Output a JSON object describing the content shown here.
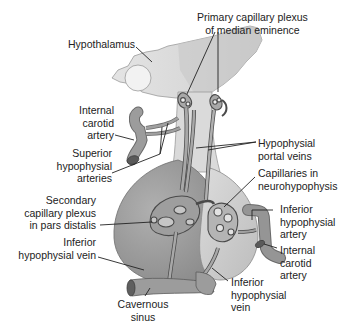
{
  "diagram": {
    "colors": {
      "background": "#ffffff",
      "hypothalamus_fill": "#e3e3e3",
      "median_eminence_fill": "#cfcfcf",
      "adenohypophysis_fill": "#9a9a9a",
      "neurohypophysis_fill": "#cdcdcd",
      "vessel_fill": "#8e8e8e",
      "vessel_outline": "#4a4a4a",
      "leader_line": "#222222",
      "label_text": "#222222"
    },
    "labels": {
      "primary_plexus": "Primary capillary plexus\nof median eminence",
      "hypothalamus": "Hypothalamus",
      "internal_carotid_left": "Internal\ncarotid\nartery",
      "superior_hypophysial": "Superior\nhypophysial\narteries",
      "portal_veins": "Hypophysial\nportal veins",
      "capillaries_neuro": "Capillaries in\nneurohypophysis",
      "secondary_plexus": "Secondary\ncapillary plexus\nin pars distalis",
      "inferior_artery": "Inferior\nhypophysial\nartery",
      "inferior_vein_left": "Inferior\nhypophysial vein",
      "internal_carotid_right": "Internal\ncarotid\nartery",
      "cavernous_sinus": "Cavernous\nsinus",
      "inferior_vein_right": "Inferior\nhypophysial\nvein"
    }
  }
}
